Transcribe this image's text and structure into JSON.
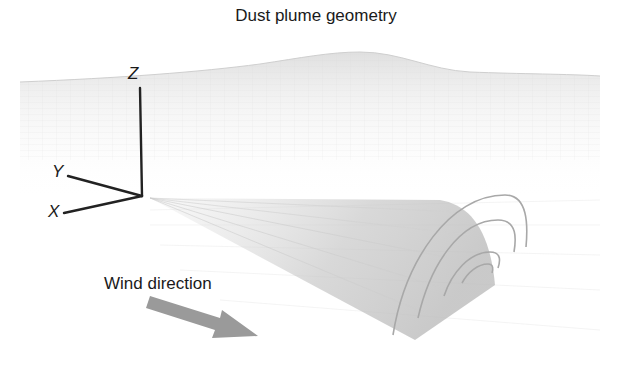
{
  "title": "Dust plume geometry",
  "axes": {
    "x_label": "X",
    "y_label": "Y",
    "z_label": "Z"
  },
  "annotations": {
    "wind_label": "Wind direction"
  },
  "colors": {
    "text": "#1a1a1a",
    "axis_lines": "#222222",
    "arrow": "#9a9a9a",
    "plume": "#bdbdbd",
    "arcs": "#a8a8a8",
    "terrain": "#e6e6e6"
  }
}
